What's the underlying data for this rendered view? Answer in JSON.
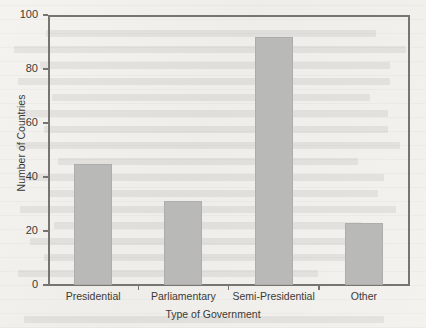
{
  "chart_data": {
    "type": "bar",
    "title": "",
    "xlabel": "Type of Government",
    "ylabel": "Number of Countries",
    "categories": [
      "Presidential",
      "Parliamentary",
      "Semi-Presidential",
      "Other"
    ],
    "values": [
      45,
      31,
      92,
      23
    ],
    "ylim": [
      0,
      100
    ],
    "yticks": [
      0,
      20,
      40,
      60,
      80,
      100
    ],
    "ytick_labels": [
      "0",
      "20",
      "40",
      "60",
      "80",
      "100"
    ],
    "grid": false,
    "legend": "none",
    "bar_color": "#b9b9b7",
    "axis_color": "#76756f",
    "text_color": "#3b3a37",
    "background_color": "#f2f1ee"
  },
  "showthrough": {
    "description": "faint reverse-side text bleed from scanned page",
    "rows": [
      {
        "top": 30,
        "left": 46,
        "width": 330
      },
      {
        "top": 46,
        "left": 14,
        "width": 392
      },
      {
        "top": 62,
        "left": 40,
        "width": 350
      },
      {
        "top": 78,
        "left": 18,
        "width": 372
      },
      {
        "top": 94,
        "left": 52,
        "width": 318
      },
      {
        "top": 110,
        "left": 22,
        "width": 366
      },
      {
        "top": 126,
        "left": 44,
        "width": 344
      },
      {
        "top": 142,
        "left": 16,
        "width": 384
      },
      {
        "top": 158,
        "left": 58,
        "width": 300
      },
      {
        "top": 174,
        "left": 26,
        "width": 358
      },
      {
        "top": 190,
        "left": 48,
        "width": 330
      },
      {
        "top": 206,
        "left": 20,
        "width": 376
      },
      {
        "top": 222,
        "left": 54,
        "width": 308
      },
      {
        "top": 238,
        "left": 30,
        "width": 352
      },
      {
        "top": 254,
        "left": 44,
        "width": 326
      },
      {
        "top": 270,
        "left": 18,
        "width": 300
      },
      {
        "top": 316,
        "left": 24,
        "width": 360
      }
    ]
  }
}
